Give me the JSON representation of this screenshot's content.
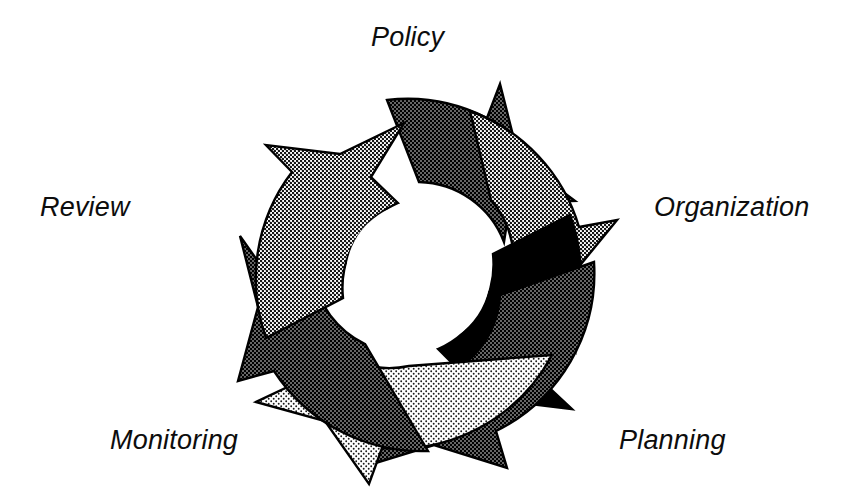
{
  "figure": {
    "type": "cycle-diagram",
    "shape": "circular-arrow-ring",
    "background_color": "#ffffff",
    "outline_color": "#000000",
    "direction": "clockwise",
    "arrow_count": 6,
    "center": {
      "x": 418,
      "y": 275
    },
    "outer_radius": 176,
    "inner_radius": 93
  },
  "labels": {
    "policy": "Policy",
    "organization": "Organization",
    "planning": "Planning",
    "monitoring": "Monitoring",
    "review": "Review"
  },
  "stages": [
    {
      "name": "Policy",
      "position": "top",
      "label_x": 371,
      "label_y": 24
    },
    {
      "name": "Organization",
      "position": "right",
      "label_x": 654,
      "label_y": 194
    },
    {
      "name": "Planning",
      "position": "bottom-right",
      "label_x": 619,
      "label_y": 427
    },
    {
      "name": "Monitoring",
      "position": "bottom-left",
      "label_x": 110,
      "label_y": 427
    },
    {
      "name": "Review",
      "position": "left",
      "label_x": 40,
      "label_y": 194
    }
  ],
  "arrows": [
    {
      "id": "arrow-top",
      "tone": "dark-gray",
      "fill": "#3a3a3a",
      "start_angle": -97,
      "end_angle": -29
    },
    {
      "id": "arrow-upper-right",
      "tone": "medium-gray",
      "fill": "#949494",
      "start_angle": -37,
      "end_angle": 31
    },
    {
      "id": "arrow-right",
      "tone": "black",
      "fill": "#000000",
      "start_angle": 23,
      "end_angle": 91
    },
    {
      "id": "arrow-lower-right",
      "tone": "dark-gray",
      "fill": "#3a3a3a",
      "start_angle": 83,
      "end_angle": 151
    },
    {
      "id": "arrow-bottom",
      "tone": "light-gray",
      "fill": "#d2d2d2",
      "start_angle": 143,
      "end_angle": 211
    },
    {
      "id": "arrow-left",
      "tone": "dark-gray",
      "fill": "#3a3a3a",
      "start_angle": 203,
      "end_angle": 271
    },
    {
      "id": "arrow-upper-left",
      "tone": "medium-gray",
      "fill": "#949494",
      "start_angle": 263,
      "end_angle": 331
    }
  ],
  "palette": {
    "black": "#000000",
    "dark_gray": "#3a3a3a",
    "medium_gray": "#949494",
    "light_gray": "#d2d2d2",
    "white": "#ffffff"
  }
}
